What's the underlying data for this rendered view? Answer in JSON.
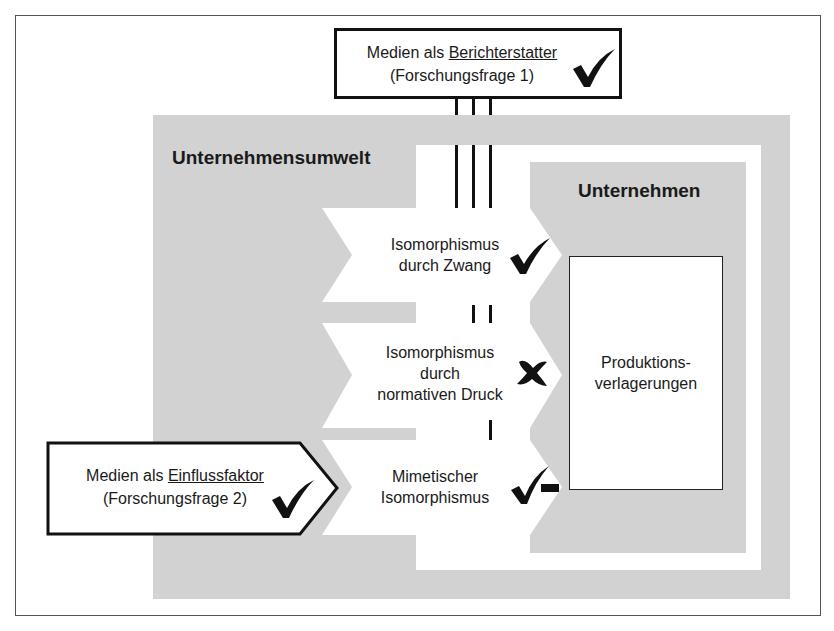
{
  "diagram": {
    "colors": {
      "gray": "#d2d2d2",
      "white": "#ffffff",
      "ink": "#111111"
    },
    "top_box": {
      "line1_prefix": "Medien als ",
      "line1_underlined": "Berichterstatter",
      "line2": "(Forschungsfrage 1)",
      "status": "check"
    },
    "left_box": {
      "line1_prefix": "Medien als ",
      "line1_underlined": "Einflussfaktor",
      "line2": "(Forschungsfrage 2)",
      "status": "check"
    },
    "environment_label": "Unternehmensumwelt",
    "company_label": "Unternehmen",
    "company_box": {
      "line1": "Produktions-",
      "line2": "verlagerungen"
    },
    "mechanisms": [
      {
        "line1": "Isomorphismus",
        "line2": "durch Zwang",
        "line3": "",
        "status": "check"
      },
      {
        "line1": "Isomorphismus",
        "line2": "durch",
        "line3": "normativen Druck",
        "status": "cross"
      },
      {
        "line1": "Mimetischer",
        "line2": "Isomorphismus",
        "line3": "",
        "status": "partial-check"
      }
    ]
  }
}
